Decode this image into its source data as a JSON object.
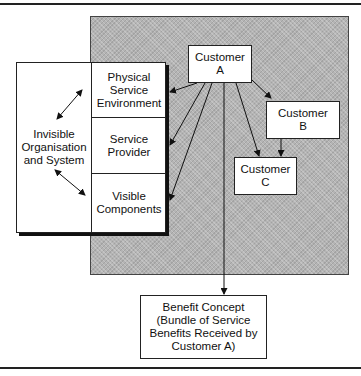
{
  "diagram": {
    "left_panel": {
      "invisible_label": "Invisible\nOrganisation\nand System",
      "rows": [
        {
          "label": "Physical\nService\nEnvironment"
        },
        {
          "label": "Service\nProvider"
        },
        {
          "label": "Visible\nComponents"
        }
      ]
    },
    "customers": {
      "a": "Customer\nA",
      "b": "Customer\nB",
      "c": "Customer\nC"
    },
    "benefit": "Benefit Concept\n(Bundle of Service\nBenefits Received by\nCustomer A)",
    "colors": {
      "shaded_area": "#b4b4b4",
      "line": "#111111",
      "box_fill": "#ffffff"
    },
    "edges": [
      {
        "from": "Customer A",
        "to": "Physical Service Environment"
      },
      {
        "from": "Customer A",
        "to": "Service Provider"
      },
      {
        "from": "Customer A",
        "to": "Visible Components"
      },
      {
        "from": "Customer A",
        "to": "Benefit Concept"
      },
      {
        "from": "Customer A",
        "to": "Customer B"
      },
      {
        "from": "Customer A",
        "to": "Customer C"
      },
      {
        "from": "Customer B",
        "to": "Customer C"
      },
      {
        "from": "Invisible Organisation and System",
        "to": "Physical Service Environment",
        "bidirectional": true
      },
      {
        "from": "Invisible Organisation and System",
        "to": "Visible Components",
        "bidirectional": true
      }
    ]
  }
}
